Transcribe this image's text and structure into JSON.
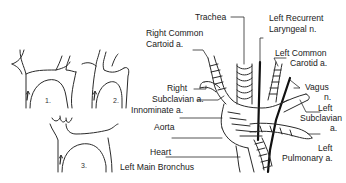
{
  "figure": {
    "type": "anatomical-diagram",
    "line_color": "#1a1a1a",
    "background": "#ffffff"
  },
  "variants": [
    {
      "number": "1."
    },
    {
      "number": "2."
    },
    {
      "number": "3."
    }
  ],
  "labels": {
    "trachea": "Trachea",
    "right_common_carotid_1": "Right Common",
    "right_common_carotid_2": "Cartoid a.",
    "left_recurrent_1": "Left Recurrent",
    "left_recurrent_2": "Laryngeal n.",
    "left_common_carotid_1": "Left Common",
    "left_common_carotid_2": "Carotid a.",
    "vagus_1": "Vagus",
    "vagus_2": "n.",
    "right_subclavian_1": "Right",
    "right_subclavian_2": "Subclavian a.",
    "innominate": "Innominate a.",
    "left_subclavian_1": "Left",
    "left_subclavian_2": "Subclavian",
    "left_subclavian_3": "a.",
    "aorta": "Aorta",
    "heart": "Heart",
    "left_pulmonary_1": "Left",
    "left_pulmonary_2": "Pulmonary a.",
    "left_main_bronchus": "Left Main Bronchus"
  }
}
